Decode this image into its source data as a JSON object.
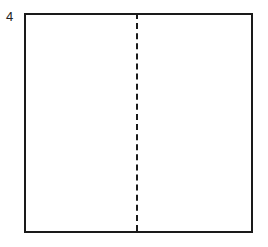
{
  "figure": {
    "step_label": "4",
    "shape": "square",
    "fold_line": {
      "orientation": "vertical",
      "style": "dashed",
      "position": "center"
    },
    "stroke_color": "#1a1a1a"
  }
}
